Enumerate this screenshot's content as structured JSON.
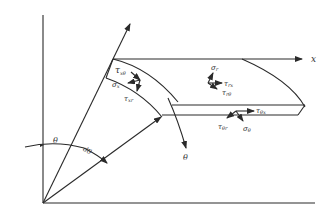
{
  "diagram": {
    "type": "stress element on curved beam in polar coordinates",
    "colors": {
      "line": "#2a2a2a",
      "text": "#333333",
      "background": "#ffffff"
    },
    "axes": {
      "x_label": "x",
      "theta_label": "θ"
    },
    "angles": {
      "theta": "θ",
      "dtheta": "dθ"
    },
    "stresses": {
      "tau_x_theta": "τ",
      "tau_x_theta_sub": "xθ",
      "sigma_x": "σ",
      "sigma_x_sub": "x",
      "tau_xr": "τ",
      "tau_xr_sub": "xr",
      "sigma_r": "σ",
      "sigma_r_sub": "r",
      "tau_rx": "τ",
      "tau_rx_sub": "rx",
      "tau_r_theta": "τ",
      "tau_r_theta_sub": "rθ",
      "tau_theta_x": "τ",
      "tau_theta_x_sub": "θx",
      "tau_theta_r": "τ",
      "tau_theta_r_sub": "θr",
      "sigma_theta": "σ",
      "sigma_theta_sub": "θ"
    }
  }
}
